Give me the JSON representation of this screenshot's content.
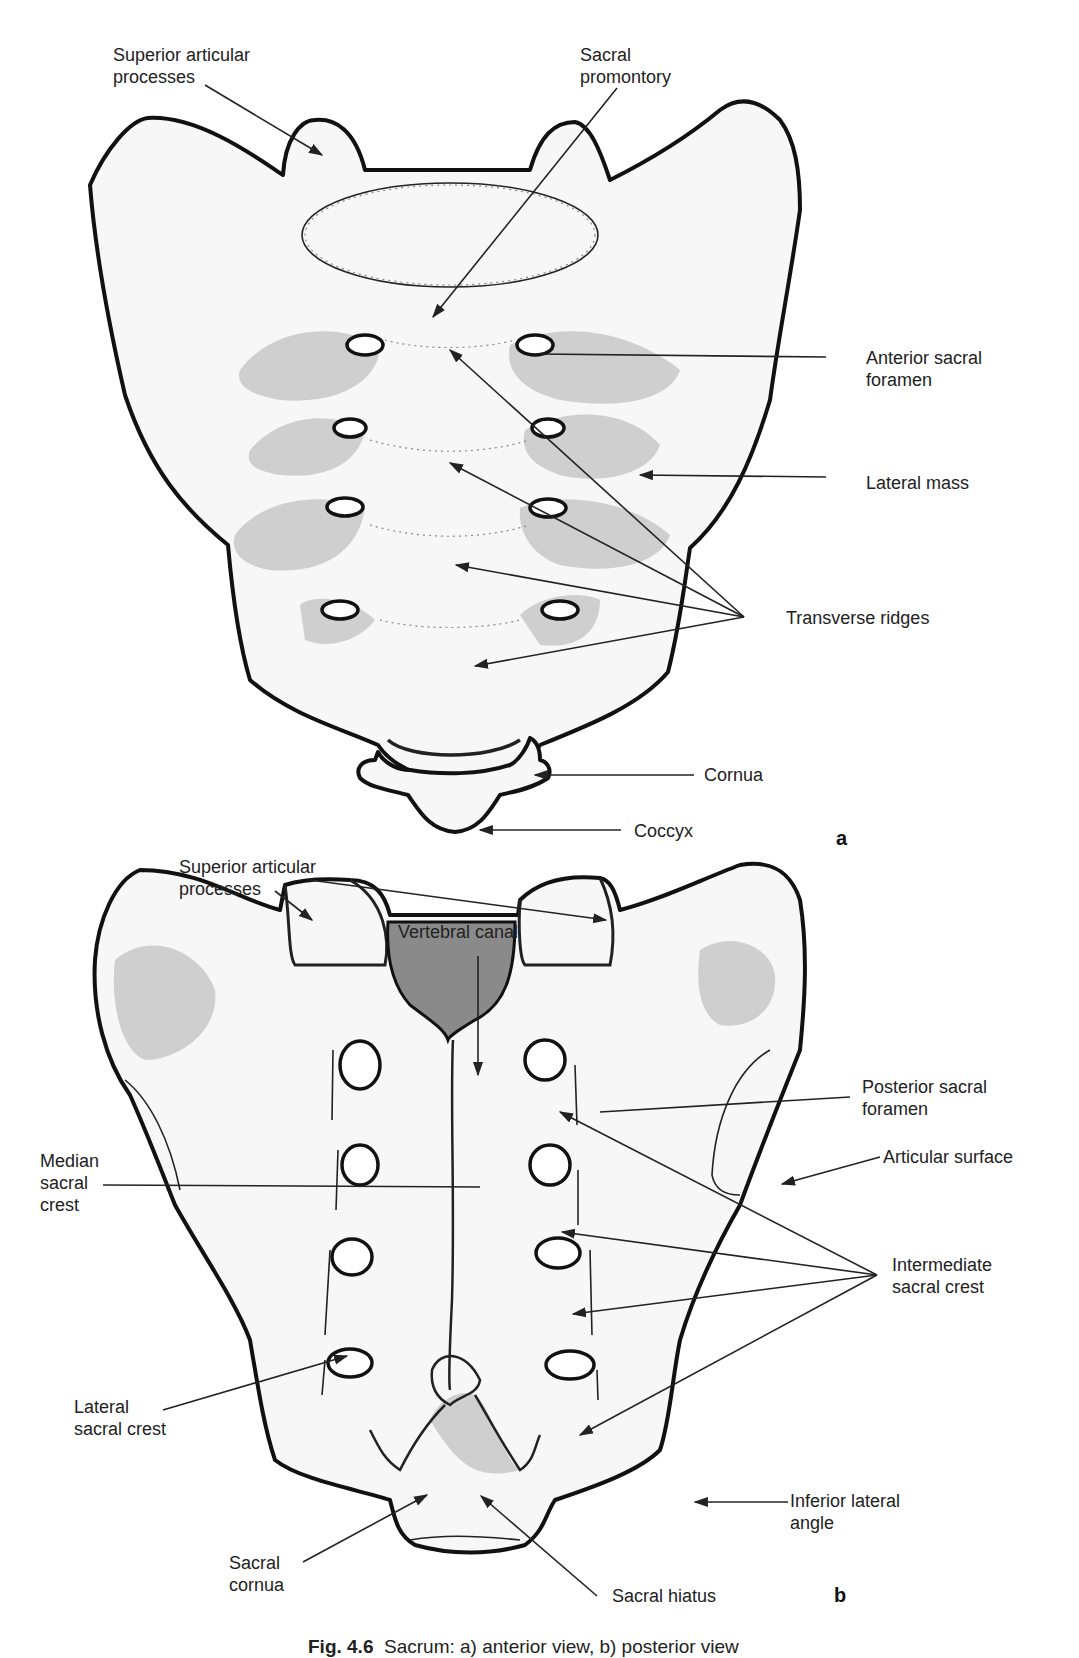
{
  "figure": {
    "caption": {
      "number": "Fig. 4.6",
      "text": "Sacrum: a) anterior view, b) posterior view"
    },
    "panels": [
      {
        "id": "a",
        "label": "a",
        "view": "anterior",
        "annotations": [
          {
            "text": "Superior articular\nprocesses"
          },
          {
            "text": "Sacral\npromontory"
          },
          {
            "text": "Anterior sacral\nforamen"
          },
          {
            "text": "Lateral mass"
          },
          {
            "text": "Transverse ridges"
          },
          {
            "text": "Cornua"
          },
          {
            "text": "Coccyx"
          }
        ]
      },
      {
        "id": "b",
        "label": "b",
        "view": "posterior",
        "annotations": [
          {
            "text": "Superior articular\nprocesses"
          },
          {
            "text": "Vertebral canal"
          },
          {
            "text": "Posterior sacral\nforamen"
          },
          {
            "text": "Articular surface"
          },
          {
            "text": "Median\nsacral\ncrest"
          },
          {
            "text": "Intermediate\nsacral crest"
          },
          {
            "text": "Lateral\nsacral crest"
          },
          {
            "text": "Inferior lateral\nangle"
          },
          {
            "text": "Sacral\ncornua"
          },
          {
            "text": "Sacral hiatus"
          }
        ]
      }
    ]
  }
}
